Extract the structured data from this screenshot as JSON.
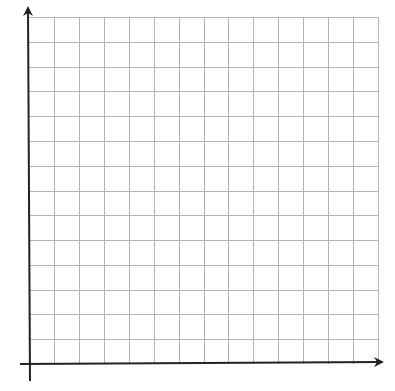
{
  "figure": {
    "type": "blank-coordinate-grid",
    "grid": {
      "columns": 14,
      "rows": 14,
      "origin_px": [
        29,
        364
      ],
      "right_px": 378,
      "top_px": 17,
      "line_color": "#b4b4b4",
      "line_width": 1
    },
    "axes": {
      "color": "#222222",
      "width": 2,
      "x_axis": {
        "from_px": [
          20,
          364
        ],
        "to_px": [
          382,
          362
        ],
        "arrow": "right"
      },
      "y_axis": {
        "from_px": [
          30,
          381
        ],
        "to_px": [
          28,
          8
        ],
        "arrow": "up"
      }
    }
  },
  "chart_data": {
    "type": "grid",
    "title": "",
    "xlabel": "",
    "ylabel": "",
    "x_gridlines": 14,
    "y_gridlines": 14,
    "grid": true,
    "series": []
  }
}
